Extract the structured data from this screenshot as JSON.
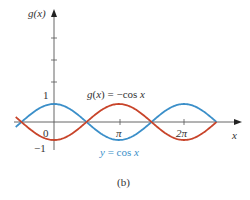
{
  "chart_data": {
    "type": "line",
    "title": "",
    "caption": "(b)",
    "xlabel": "x",
    "ylabel": "g(x)",
    "x_ticks": [
      {
        "value": 0,
        "label": "0"
      },
      {
        "value": 3.14159,
        "label": "π"
      },
      {
        "value": 6.28318,
        "label": "2π"
      }
    ],
    "y_ticks": [
      {
        "value": 1,
        "label": "1"
      },
      {
        "value": -1,
        "label": "−1"
      }
    ],
    "xlim": [
      -1.9,
      7.9
    ],
    "ylim": [
      -1.3,
      4.5
    ],
    "grid": false,
    "series": [
      {
        "name": "y = cos x",
        "function": "cos(x)",
        "color": "#3b8fc9",
        "x": [
          -1.85,
          -1.5708,
          0,
          1.5708,
          3.1416,
          4.7124,
          6.2832,
          7.854
        ],
        "values": [
          -0.28,
          0,
          1,
          0,
          -1,
          0,
          1,
          0
        ]
      },
      {
        "name": "g(x) = −cos x",
        "function": "-cos(x)",
        "color": "#c8442a",
        "x": [
          -1.85,
          -1.5708,
          0,
          1.5708,
          3.1416,
          4.7124,
          6.2832,
          7.854
        ],
        "values": [
          0.28,
          0,
          -1,
          0,
          1,
          0,
          -1,
          0
        ]
      }
    ],
    "annotations": [
      {
        "text": "g(x) = −cos x",
        "color": "#333333"
      },
      {
        "text": "y = cos x",
        "color": "#3b8fc9"
      }
    ]
  },
  "labels": {
    "ylabel": "g(x)",
    "xlabel": "x",
    "tick_0": "0",
    "tick_pi": "π",
    "tick_2pi": "2π",
    "tick_1": "1",
    "tick_m1": "−1",
    "g_label": "g(x) = −cos x",
    "y_label": "y = cos x",
    "caption": "(b)"
  }
}
